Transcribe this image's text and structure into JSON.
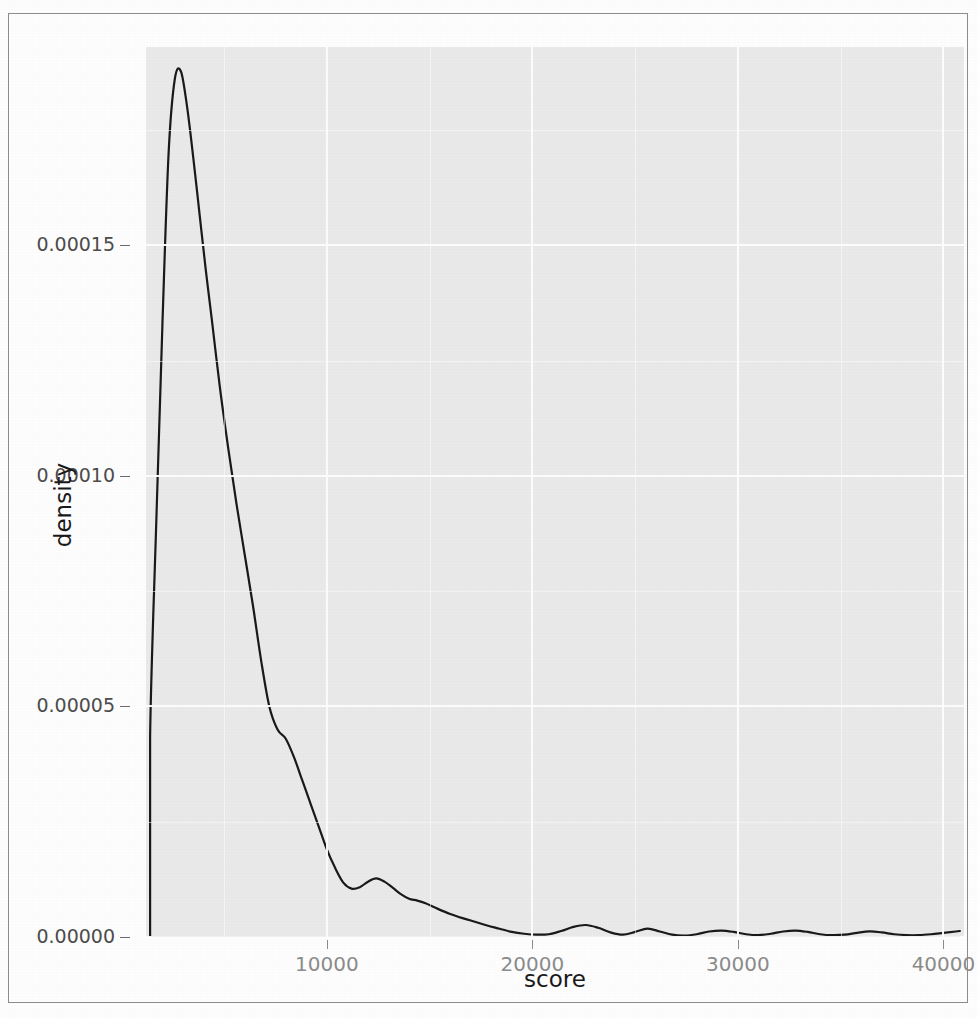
{
  "chart_data": {
    "type": "line",
    "title": "",
    "subtitle": "",
    "xlabel": "score",
    "ylabel": "density",
    "xlim": [
      1200,
      41000
    ],
    "ylim": [
      0.0,
      0.000193
    ],
    "grid": true,
    "legend": null,
    "x_ticks": [
      10000,
      20000,
      30000,
      40000
    ],
    "x_tick_labels": [
      "10000",
      "20000",
      "30000",
      "40000"
    ],
    "y_ticks": [
      0.0,
      5e-05,
      0.0001,
      0.00015
    ],
    "y_tick_labels": [
      "0.00000",
      "0.00005",
      "0.00010",
      "0.00015"
    ],
    "series": [
      {
        "name": "density",
        "x": [
          1400,
          1400,
          1700,
          2000,
          2300,
          2600,
          2900,
          3200,
          3500,
          3800,
          4100,
          4400,
          4800,
          5200,
          5600,
          6000,
          6400,
          6800,
          7200,
          7600,
          8000,
          8400,
          8800,
          9200,
          9600,
          10000,
          10400,
          10800,
          11200,
          11600,
          12000,
          12400,
          12800,
          13200,
          13600,
          14000,
          14400,
          14800,
          15400,
          16000,
          16600,
          17200,
          17800,
          18400,
          19000,
          19600,
          20200,
          20800,
          21400,
          22000,
          22600,
          23200,
          23800,
          24400,
          25000,
          25600,
          26200,
          26800,
          27400,
          28000,
          28600,
          29200,
          29800,
          30400,
          31000,
          31600,
          32200,
          32800,
          33400,
          34000,
          34600,
          35200,
          35800,
          36400,
          37000,
          37600,
          38200,
          38800,
          39400,
          40000,
          40600,
          40800
        ],
        "y": [
          0.0,
          4.35e-05,
          9e-05,
          0.000133,
          0.00017,
          0.000186,
          0.0001877,
          0.00018,
          0.000169,
          0.000157,
          0.000145,
          0.000134,
          0.000119,
          0.000106,
          9.4e-05,
          8.3e-05,
          7.2e-05,
          6e-05,
          5e-05,
          4.5e-05,
          4.3e-05,
          3.9e-05,
          3.4e-05,
          2.9e-05,
          2.4e-05,
          1.9e-05,
          1.5e-05,
          1.18e-05,
          1.05e-05,
          1.08e-05,
          1.2e-05,
          1.27e-05,
          1.2e-05,
          1.07e-05,
          9.3e-06,
          8.3e-06,
          7.9e-06,
          7.3e-06,
          6.1e-06,
          5e-06,
          4.1e-06,
          3.3e-06,
          2.5e-06,
          1.8e-06,
          1.1e-06,
          7e-07,
          5e-07,
          6e-07,
          1.3e-06,
          2.2e-06,
          2.6e-06,
          2e-06,
          1e-06,
          5e-07,
          1.1e-06,
          1.8e-06,
          1.2e-06,
          5e-07,
          3e-07,
          6e-07,
          1.2e-06,
          1.4e-06,
          1.1e-06,
          6e-07,
          4e-07,
          7e-07,
          1.2e-06,
          1.4e-06,
          1.1e-06,
          6e-07,
          4e-07,
          5e-07,
          9e-07,
          1.2e-06,
          1e-06,
          6e-07,
          4e-07,
          4e-07,
          6e-07,
          9e-07,
          1.2e-06,
          1.3e-06
        ],
        "color": "#1a1a1a",
        "linewidth": 2.2
      }
    ],
    "annotations": [],
    "peak": {
      "x": 2900,
      "y": 0.0001877
    },
    "secondary_bump": {
      "x": 12400,
      "y": 1.27e-05
    },
    "panel_background": "#ebebeb",
    "grid_color": "#ffffff",
    "line_color": "#1a1a1a"
  },
  "axes": {
    "x_title": "score",
    "y_title": "density"
  }
}
